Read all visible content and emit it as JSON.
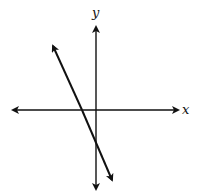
{
  "diagram": {
    "type": "coordinate-plane",
    "axes": {
      "x_label": "x",
      "y_label": "y",
      "origin_px": [
        96,
        110
      ]
    },
    "line": {
      "slope_sign": "negative",
      "x_intercept_sign": "negative",
      "y_intercept_sign": "negative",
      "start_px": [
        52,
        44
      ],
      "end_px": [
        113,
        182
      ]
    },
    "colors": {
      "stroke": "#111111",
      "background": "#ffffff"
    }
  }
}
